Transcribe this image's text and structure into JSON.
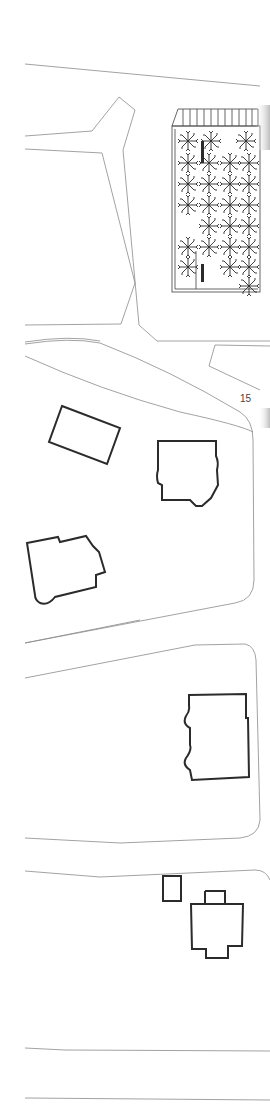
{
  "drawing": {
    "type": "site plan",
    "page_number_label": "15",
    "colors": {
      "background": "#ffffff",
      "road_line": "#8a8a8a",
      "building_outline": "#2b2b2b",
      "page_edge_shadow": "#bdbdbd"
    },
    "sections": [
      {
        "name": "plaza-block",
        "features": [
          "forked road",
          "tree grove",
          "pergola"
        ],
        "tree_count": 31
      },
      {
        "name": "villa-block-1",
        "buildings": 3
      },
      {
        "name": "villa-block-2",
        "buildings": 1
      },
      {
        "name": "villa-block-3",
        "buildings": 2
      }
    ]
  }
}
